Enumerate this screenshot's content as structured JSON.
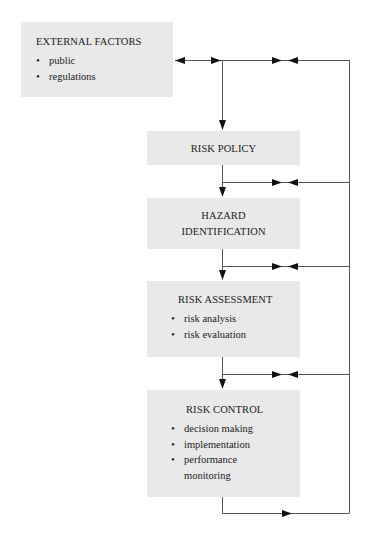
{
  "diagram": {
    "type": "flowchart",
    "colors": {
      "box_fill": "#e9e9e9",
      "line": "#555555",
      "arrow": "#111111",
      "text": "#222222"
    },
    "boxes": {
      "external": {
        "title": "EXTERNAL FACTORS",
        "items": [
          "public",
          "regulations"
        ]
      },
      "policy": {
        "title": "RISK POLICY"
      },
      "hazard": {
        "title_line1": "HAZARD",
        "title_line2": "IDENTIFICATION"
      },
      "assessment": {
        "title": "RISK ASSESSMENT",
        "items": [
          "risk analysis",
          "risk evaluation"
        ]
      },
      "control": {
        "title": "RISK CONTROL",
        "items": [
          "decision making",
          "implementation",
          "performance",
          "monitoring"
        ]
      }
    },
    "connections": [
      {
        "from": "external",
        "to": "policy",
        "kind": "arrow-down"
      },
      {
        "from": "policy",
        "to": "hazard",
        "kind": "arrow-down"
      },
      {
        "from": "hazard",
        "to": "assessment",
        "kind": "arrow-down"
      },
      {
        "from": "assessment",
        "to": "control",
        "kind": "arrow-down"
      },
      {
        "from": "control",
        "to": "feedback-loop",
        "kind": "feedback-right"
      },
      {
        "from": "feedback-loop",
        "to": "external",
        "kind": "bidirectional"
      }
    ]
  }
}
